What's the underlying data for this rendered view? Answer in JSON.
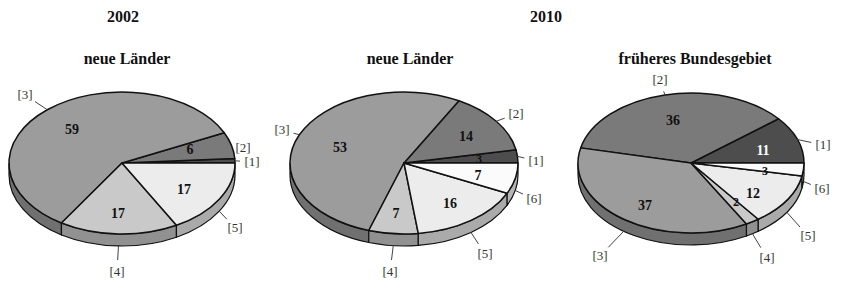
{
  "header": {
    "year_left": "2002",
    "year_right": "2010"
  },
  "colors": {
    "1": "#4d4d4d",
    "2": "#7a7a7a",
    "3": "#9c9c9c",
    "4": "#c9c9c9",
    "5": "#ececec",
    "6": "#fbfbfb"
  },
  "chart_data": [
    {
      "type": "pie",
      "title": "neue Länder",
      "year": "2002",
      "categories": [
        "[1]",
        "[2]",
        "[3]",
        "[4]",
        "[5]"
      ],
      "values": [
        1,
        6,
        59,
        17,
        17
      ],
      "labels": [
        "",
        "6",
        "59",
        "17",
        "17"
      ],
      "style": "3d-exploded-none"
    },
    {
      "type": "pie",
      "title": "neue Länder",
      "year": "2010",
      "categories": [
        "[1]",
        "[2]",
        "[3]",
        "[4]",
        "[5]",
        "[6]"
      ],
      "values": [
        3,
        14,
        53,
        7,
        16,
        7
      ],
      "labels": [
        "3",
        "14",
        "53",
        "7",
        "16",
        "7"
      ],
      "style": "3d"
    },
    {
      "type": "pie",
      "title": "früheres Bundesgebiet",
      "year": "2010",
      "categories": [
        "[1]",
        "[2]",
        "[3]",
        "[4]",
        "[5]",
        "[6]"
      ],
      "values": [
        11,
        36,
        37,
        2,
        12,
        3
      ],
      "labels": [
        "11",
        "36",
        "37",
        "2",
        "12",
        "3"
      ],
      "style": "3d"
    }
  ]
}
